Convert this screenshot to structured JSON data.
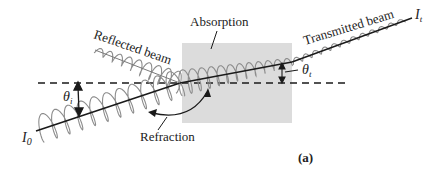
{
  "figure": {
    "panel_label": "(a)",
    "labels": {
      "reflected": "Reflected beam",
      "absorption": "Absorption",
      "transmitted": "Transmitted beam",
      "refraction": "Refraction",
      "incident_intensity": "I",
      "incident_intensity_sub": "0",
      "transmitted_intensity": "I",
      "transmitted_intensity_sub": "t",
      "incident_angle": "θ",
      "incident_angle_sub": "i",
      "transmitted_angle": "θ",
      "transmitted_angle_sub": "t"
    },
    "colors": {
      "medium": "#dcdcdc",
      "wave": "#8c8c8c",
      "line": "#1a1a1a"
    }
  }
}
